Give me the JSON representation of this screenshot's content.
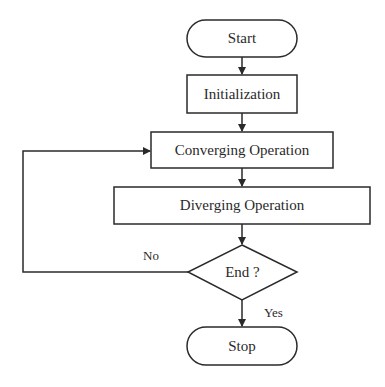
{
  "diagram": {
    "type": "flowchart",
    "nodes": {
      "start": {
        "label": "Start",
        "shape": "terminator"
      },
      "init": {
        "label": "Initialization",
        "shape": "process"
      },
      "converging": {
        "label": "Converging Operation",
        "shape": "process"
      },
      "diverging": {
        "label": "Diverging Operation",
        "shape": "process"
      },
      "end_check": {
        "label": "End ?",
        "shape": "decision"
      },
      "stop": {
        "label": "Stop",
        "shape": "terminator"
      }
    },
    "edges": {
      "no_label": "No",
      "yes_label": "Yes"
    },
    "colors": {
      "stroke": "#2a2a2a",
      "background": "#ffffff"
    }
  }
}
